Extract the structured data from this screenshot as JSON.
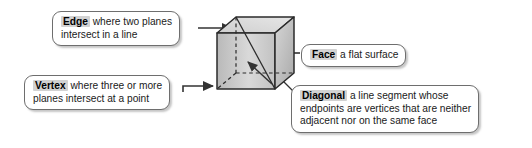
{
  "figure": {
    "background_color": "#ffffff",
    "shape": {
      "name": "cube",
      "fill_light": "#dcdcdc",
      "fill_mid": "#c3c3c3",
      "fill_dark": "#a8a8a8",
      "stroke_color": "#2b2b2b",
      "hidden_edge_style": "dashed",
      "has_space_diagonal": true
    },
    "callouts": [
      {
        "id": "edge",
        "term": "Edge",
        "lines": [
          "where two planes",
          "intersect in a line"
        ],
        "arrow": "points-right-to-cube-top-left-edge"
      },
      {
        "id": "vertex",
        "term": "Vertex",
        "lines": [
          "where three or more",
          "planes intersect at a point"
        ],
        "arrow": "points-right-to-cube-bottom-left-vertex"
      },
      {
        "id": "face",
        "term": "Face",
        "lines": [
          "a flat surface"
        ],
        "arrow": "points-left-to-cube-right-face"
      },
      {
        "id": "diagonal",
        "term": "Diagonal",
        "lines": [
          "a line segment whose",
          "endpoints are vertices that are neither",
          "adjacent nor on the same face"
        ],
        "arrow": "leader-line-to-cube-space-diagonal"
      }
    ]
  }
}
